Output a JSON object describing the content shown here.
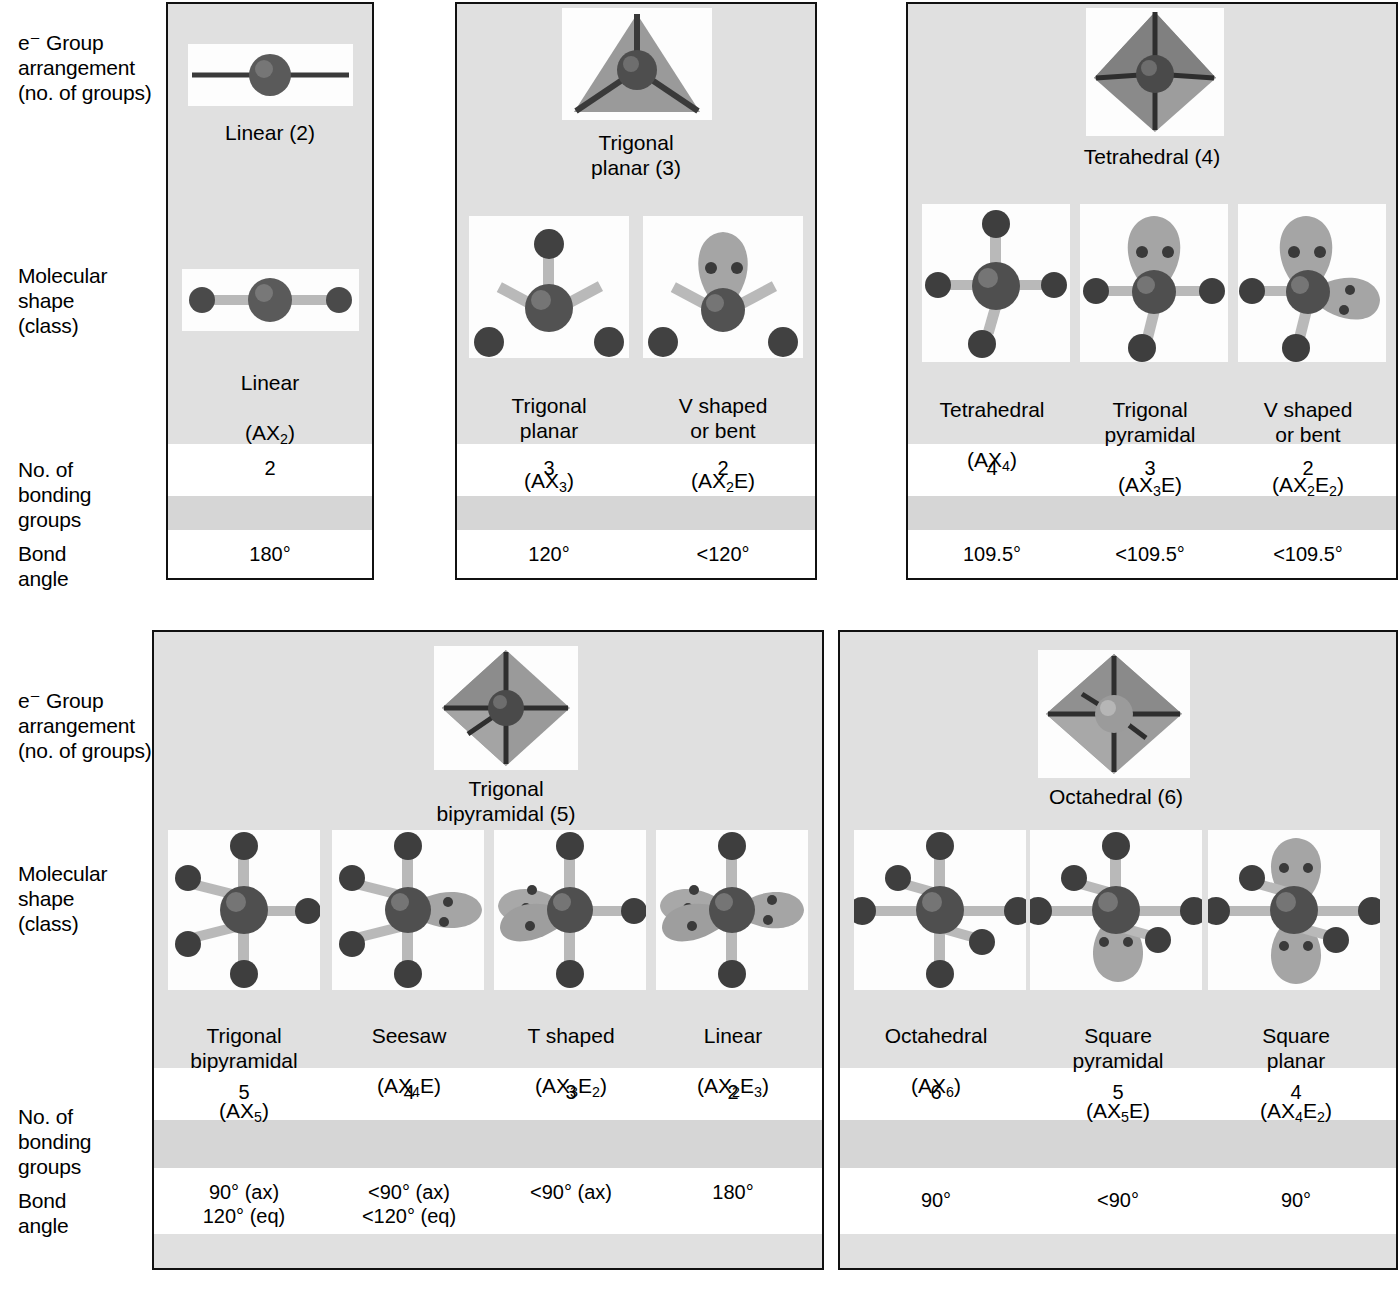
{
  "figure": {
    "row_labels": [
      "e⁻ Group\narrangement\n(no. of groups)",
      "Molecular\nshape\n(class)",
      "No. of\nbonding\ngroups",
      "Bond\nangle"
    ],
    "caption": ""
  },
  "top": {
    "panels": [
      {
        "id": "linear",
        "egroup_label": "Linear (2)",
        "egroup_icon": "linear-eg-icon",
        "columns": [
          {
            "shape_label": "Linear",
            "class_label": "(AX₂)",
            "class_parts": {
              "pre": "(AX",
              "sub": "2",
              "post": ")"
            },
            "bonding_groups": "2",
            "bond_angle": "180°",
            "icon": "linear-ax2-icon"
          }
        ]
      },
      {
        "id": "trigonal-planar",
        "egroup_label": "Trigonal\nplanar (3)",
        "egroup_icon": "trigonal-planar-eg-icon",
        "columns": [
          {
            "shape_label": "Trigonal\nplanar",
            "class_parts": {
              "pre": "(AX",
              "sub": "3",
              "post": ")"
            },
            "bonding_groups": "3",
            "bond_angle": "120°",
            "icon": "trigonal-planar-ax3-icon"
          },
          {
            "shape_label": "V shaped\nor bent",
            "class_parts": {
              "pre": "(AX",
              "sub": "2",
              "post": "E)"
            },
            "bonding_groups": "2",
            "bond_angle": "<120°",
            "icon": "bent-ax2e-icon"
          }
        ]
      },
      {
        "id": "tetrahedral",
        "egroup_label": "Tetrahedral (4)",
        "egroup_icon": "tetrahedral-eg-icon",
        "columns": [
          {
            "shape_label": "Tetrahedral",
            "class_parts": {
              "pre": "(AX",
              "sub": "4",
              "post": ")"
            },
            "bonding_groups": "4",
            "bond_angle": "109.5°",
            "icon": "tetrahedral-ax4-icon"
          },
          {
            "shape_label": "Trigonal\npyramidal",
            "class_parts": {
              "pre": "(AX",
              "sub": "3",
              "post": "E)"
            },
            "bonding_groups": "3",
            "bond_angle": "<109.5°",
            "icon": "trigonal-pyramidal-ax3e-icon"
          },
          {
            "shape_label": "V shaped\nor bent",
            "class_parts": {
              "pre": "(AX",
              "sub": "2",
              "post": "E",
              "sub2": "2",
              "post2": ")"
            },
            "bonding_groups": "2",
            "bond_angle": "<109.5°",
            "icon": "bent-ax2e2-icon"
          }
        ]
      }
    ]
  },
  "bottom": {
    "panels": [
      {
        "id": "trigonal-bipyramidal",
        "egroup_label": "Trigonal\nbipyramidal (5)",
        "egroup_icon": "trigonal-bipyramidal-eg-icon",
        "columns": [
          {
            "shape_label": "Trigonal\nbipyramidal",
            "class_parts": {
              "pre": "(AX",
              "sub": "5",
              "post": ")"
            },
            "bonding_groups": "5",
            "bond_angle": "90° (ax)\n120° (eq)",
            "icon": "trigonal-bipyramidal-ax5-icon"
          },
          {
            "shape_label": "Seesaw",
            "class_parts": {
              "pre": "(AX",
              "sub": "4",
              "post": "E)"
            },
            "bonding_groups": "4",
            "bond_angle": "<90° (ax)\n<120° (eq)",
            "icon": "seesaw-ax4e-icon"
          },
          {
            "shape_label": "T shaped",
            "class_parts": {
              "pre": "(AX",
              "sub": "3",
              "post": "E",
              "sub2": "2",
              "post2": ")"
            },
            "bonding_groups": "3",
            "bond_angle": "<90° (ax)",
            "icon": "t-shaped-ax3e2-icon"
          },
          {
            "shape_label": "Linear",
            "class_parts": {
              "pre": "(AX",
              "sub": "2",
              "post": "E",
              "sub2": "3",
              "post2": ")"
            },
            "bonding_groups": "2",
            "bond_angle": "180°",
            "icon": "linear-ax2e3-icon"
          }
        ]
      },
      {
        "id": "octahedral",
        "egroup_label": "Octahedral  (6)",
        "egroup_icon": "octahedral-eg-icon",
        "columns": [
          {
            "shape_label": "Octahedral",
            "class_parts": {
              "pre": "(AX",
              "sub": "6",
              "post": ")"
            },
            "bonding_groups": "6",
            "bond_angle": "90°",
            "icon": "octahedral-ax6-icon"
          },
          {
            "shape_label": "Square\npyramidal",
            "class_parts": {
              "pre": "(AX",
              "sub": "5",
              "post": "E)"
            },
            "bonding_groups": "5",
            "bond_angle": "<90°",
            "icon": "square-pyramidal-ax5e-icon"
          },
          {
            "shape_label": "Square\nplanar",
            "class_parts": {
              "pre": "(AX",
              "sub": "4",
              "post": "E",
              "sub2": "2",
              "post2": ")"
            },
            "bonding_groups": "4",
            "bond_angle": "90°",
            "icon": "square-planar-ax4e2-icon"
          }
        ]
      }
    ]
  },
  "colors": {
    "panel_bg": "#e0e0e0",
    "band_white": "#ffffff",
    "band_gray": "#d6d6d6",
    "border": "#111111",
    "atom_dark": "#4a4a4a",
    "bond_light": "#b9b9b9",
    "lonepair": "#9a9a9a",
    "polyhedron": "#8e8e8e"
  }
}
